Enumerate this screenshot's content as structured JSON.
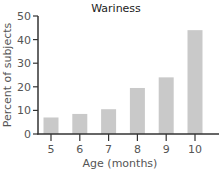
{
  "chart_data": {
    "type": "bar",
    "title": "Wariness",
    "xlabel": "Age (months)",
    "ylabel": "Percent of subjects",
    "categories": [
      "5",
      "6",
      "7",
      "8",
      "9",
      "10"
    ],
    "values": [
      7,
      8.5,
      10.5,
      19.5,
      24,
      44
    ],
    "ylim": [
      0,
      50
    ],
    "yticks": [
      0,
      10,
      20,
      30,
      40,
      50
    ],
    "grid": false,
    "legend": null,
    "bar_color": "#c9c9c9",
    "axis_color": "#333333"
  }
}
